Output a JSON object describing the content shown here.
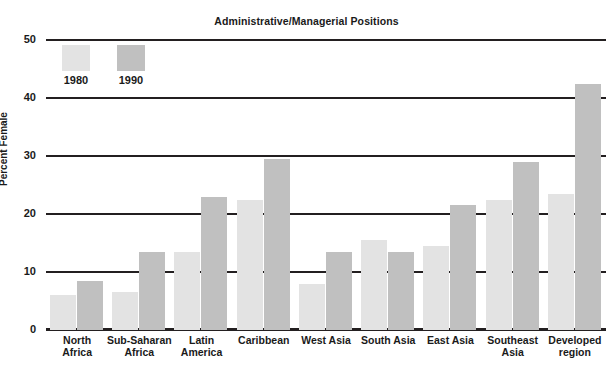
{
  "chart_data": {
    "type": "bar",
    "title": "Administrative/Managerial Positions",
    "xlabel": "",
    "ylabel": "Percent Female",
    "ylim": [
      0,
      50
    ],
    "yticks": [
      0,
      10,
      20,
      30,
      40,
      50
    ],
    "grid": true,
    "legend_position": "top-left",
    "categories": [
      "North Africa",
      "Sub-Saharan Africa",
      "Latin America",
      "Caribbean",
      "West Asia",
      "South Asia",
      "East Asia",
      "Southeast Asia",
      "Developed region"
    ],
    "series": [
      {
        "name": "1980",
        "color": "#e3e3e3",
        "values": [
          6,
          6.5,
          13.5,
          22.5,
          8,
          15.5,
          14.5,
          22.5,
          23.5
        ]
      },
      {
        "name": "1990",
        "color": "#c0c0c0",
        "values": [
          8.5,
          13.5,
          23,
          29.5,
          13.5,
          13.5,
          21.5,
          29,
          42.5
        ]
      }
    ]
  },
  "axis": {
    "ylabel": "Percent Female",
    "ytick_labels": [
      "50",
      "40",
      "30",
      "20",
      "10",
      "0"
    ]
  },
  "legend": {
    "items": [
      {
        "label": "1980",
        "color": "#e3e3e3"
      },
      {
        "label": "1990",
        "color": "#c0c0c0"
      }
    ]
  },
  "xcategory_lines": [
    [
      "North",
      "Africa"
    ],
    [
      "Sub-Saharan",
      "Africa"
    ],
    [
      "Latin",
      "America"
    ],
    [
      "Caribbean",
      ""
    ],
    [
      "West Asia",
      ""
    ],
    [
      "South Asia",
      ""
    ],
    [
      "East Asia",
      ""
    ],
    [
      "Southeast",
      "Asia"
    ],
    [
      "Developed",
      "region"
    ]
  ],
  "colors": {
    "ink": "#231f20",
    "bar_1980": "#e3e3e3",
    "bar_1990": "#c0c0c0"
  }
}
